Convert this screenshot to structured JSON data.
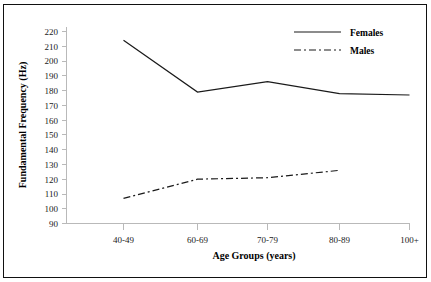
{
  "chart_data": {
    "type": "line",
    "title": "",
    "xlabel": "Age Groups (years)",
    "ylabel": "Fundamental Frequency (Hz)",
    "categories": [
      "40-49",
      "60-69",
      "70-79",
      "80-89",
      "100+"
    ],
    "ylim": [
      90,
      220
    ],
    "ytick_labels": [
      "220",
      "210",
      "200",
      "190",
      "180",
      "170",
      "160",
      "150",
      "140",
      "130",
      "120",
      "110",
      "100",
      "90"
    ],
    "ytick_values": [
      220,
      210,
      200,
      190,
      180,
      170,
      160,
      150,
      140,
      130,
      120,
      110,
      100,
      90
    ],
    "grid": false,
    "legend_position": "top-right",
    "series": [
      {
        "name": "Females",
        "style": "solid",
        "color": "#1a1a1a",
        "values": [
          214,
          179,
          186,
          178,
          177
        ]
      },
      {
        "name": "Males",
        "style": "dash-dot",
        "color": "#1a1a1a",
        "values": [
          107,
          120,
          121,
          126,
          null
        ]
      }
    ]
  },
  "legend": {
    "entries": [
      {
        "label": "Females",
        "style": "solid"
      },
      {
        "label": "Males",
        "style": "dash-dot"
      }
    ]
  },
  "axes": {
    "y_title": "Fundamental Frequency (Hz)",
    "x_title": "Age Groups (years)"
  }
}
